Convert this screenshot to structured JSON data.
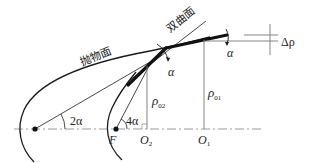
{
  "diagram": {
    "type": "optical-geometry",
    "labels": {
      "paraboloid": "抛物面",
      "hyperboloid": "双曲面",
      "alpha_left": "α",
      "alpha_right": "α",
      "delta_rho": "Δρ",
      "rho_02": "ρ",
      "rho_02_sub": "02",
      "rho_01": "ρ",
      "rho_01_sub": "01",
      "angle_2a": "2α",
      "angle_4a": "4α",
      "focus": "F",
      "o2": "O",
      "o2_sub": "2",
      "o1": "O",
      "o1_sub": "1"
    },
    "colors": {
      "line": "#1a1a1a",
      "axis": "#999999",
      "background": "#ffffff"
    }
  }
}
